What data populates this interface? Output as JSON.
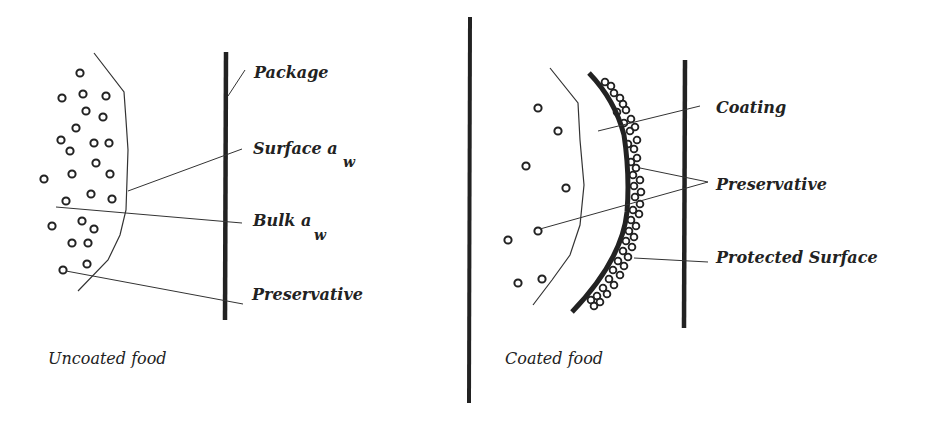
{
  "colors": {
    "ink": "#222222",
    "background": "#ffffff"
  },
  "left_panel": {
    "caption": "Uncoated food",
    "labels": {
      "package": "Package",
      "surface_aw": "Surface a",
      "surface_aw_sub": "w",
      "bulk_aw": "Bulk a",
      "bulk_aw_sub": "w",
      "preservative": "Preservative"
    }
  },
  "right_panel": {
    "caption": "Coated food",
    "labels": {
      "coating": "Coating",
      "preservative": "Preservative",
      "protected_surface": "Protected Surface"
    }
  }
}
